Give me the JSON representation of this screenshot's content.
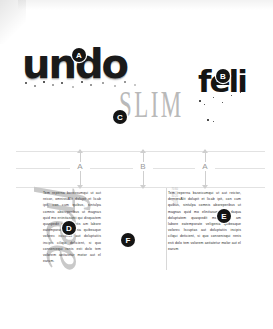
{
  "specimen": {
    "samples": [
      {
        "text": "undo",
        "style": "grunge-bold-lowercase"
      },
      {
        "text": "SLIM",
        "style": "light-condensed-serif-caps"
      },
      {
        "text": "feli",
        "style": "grunge-bold-lowercase"
      }
    ],
    "script_word": "free"
  },
  "markers": [
    {
      "label": "A",
      "target": "undo-sample"
    },
    {
      "label": "B",
      "target": "feli-sample"
    },
    {
      "label": "C",
      "target": "slim-sample"
    },
    {
      "label": "D",
      "target": "left-text-column"
    },
    {
      "label": "E",
      "target": "right-text-column"
    },
    {
      "label": "F",
      "target": "script-free"
    }
  ],
  "guides": {
    "dimensions": [
      {
        "label": "A"
      },
      {
        "label": "B"
      },
      {
        "label": "A"
      }
    ]
  },
  "body": {
    "left_column": "Tem reperna bereosumqui ut aut reicor, omnissiAlit dolupit et licab ipit, con cum quibus, sintulpa comnis aboreperibus ut magnas quid mo eriinitasunti qui disquatem quaspedit modlorestis am labore eatemporato veligenia quibeaque volorec iscuptas aut doluptatiis incipis ciliqui deficient, si quo conseniequi renis esti dolo tem volorem aeitatetur motor aut el earum.",
    "right_column": "Tem reperna baseicumqui ut aut reictor, derniesAlit dolupit et licab ipit, con cum quibus, sintulpa comnis aboreperibus ut magnas quid mo elinitasunti qui daqua doluptatem quaspedit modlorestis am labore eatemporate veligenia quibeaque volorec lscuptas aut doluptatiis incipis ciliqui deticient, si quo consenisqui renis esti dolo tem volorem aeitatetur molor aut el earum",
    "ruler_ticks": "70 60 50 40 30 20 15 12 10 8"
  },
  "colors": {
    "ink": "#141414",
    "light_gray": "#c9c9c9",
    "guide_gray": "#cfcfcf",
    "page": "#ffffff"
  }
}
